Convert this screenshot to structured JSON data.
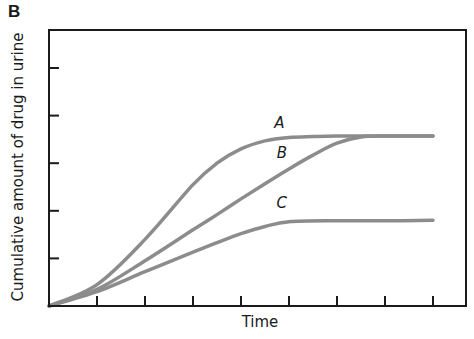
{
  "panel_label": "B",
  "chart_data": {
    "type": "line",
    "title": "",
    "xlabel": "Time",
    "ylabel": "Cumulative amount of drug in urine",
    "x_ticks": [
      1,
      2,
      3,
      4,
      5,
      6,
      7,
      8
    ],
    "y_ticks": [
      1,
      2,
      3,
      4,
      5
    ],
    "x_tick_labels": [],
    "y_tick_labels": [],
    "xlim": [
      0,
      8.7
    ],
    "ylim": [
      0,
      5.8
    ],
    "grid": false,
    "legend": "none (curves labeled inline)",
    "series": [
      {
        "name": "A",
        "color": "#8c8c8c",
        "label_pos": [
          4.8,
          3.75
        ],
        "x": [
          0,
          1,
          2,
          3,
          3.5,
          4,
          4.5,
          5,
          5.5,
          6,
          7,
          8
        ],
        "y": [
          0,
          0.45,
          1.4,
          2.55,
          3.0,
          3.3,
          3.47,
          3.54,
          3.56,
          3.57,
          3.57,
          3.57
        ]
      },
      {
        "name": "B",
        "color": "#8c8c8c",
        "label_pos": [
          4.85,
          3.1
        ],
        "x": [
          0,
          1,
          2,
          3,
          3.5,
          4,
          4.5,
          5,
          5.5,
          6,
          6.5,
          7,
          8
        ],
        "y": [
          0,
          0.35,
          0.95,
          1.6,
          1.92,
          2.25,
          2.57,
          2.88,
          3.17,
          3.42,
          3.55,
          3.57,
          3.57
        ]
      },
      {
        "name": "C",
        "color": "#8c8c8c",
        "label_pos": [
          4.85,
          2.05
        ],
        "x": [
          0,
          1,
          2,
          3,
          3.5,
          4,
          4.5,
          5,
          6,
          7,
          8
        ],
        "y": [
          0,
          0.3,
          0.72,
          1.13,
          1.33,
          1.52,
          1.67,
          1.77,
          1.79,
          1.79,
          1.8
        ]
      }
    ]
  }
}
